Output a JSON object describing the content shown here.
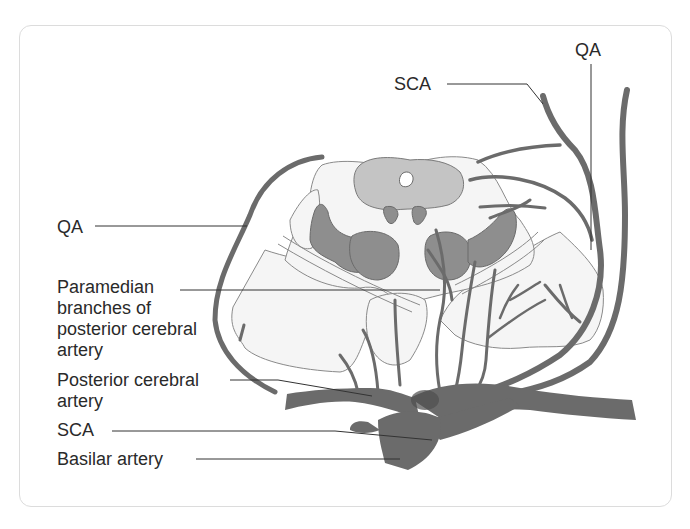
{
  "diagram": {
    "type": "anatomical-cross-section",
    "colors": {
      "vessel": "#6b6b6b",
      "vessel_dark": "#4e4e4e",
      "tissue_fill": "#f4f4f4",
      "tissue_outline": "#8a8a8a",
      "gray_matter": "#8c8c8c",
      "periaqueductal": "#c4c4c4",
      "leader_line": "#333333",
      "frame_border": "#dcdcdc"
    }
  },
  "labels": {
    "qa_top": "QA",
    "sca_top": "SCA",
    "qa_left": "QA",
    "paramedian": "Paramedian branches of posterior cerebral artery",
    "posterior_cerebral": "Posterior cerebral artery",
    "sca_bottom": "SCA",
    "basilar": "Basilar artery"
  }
}
